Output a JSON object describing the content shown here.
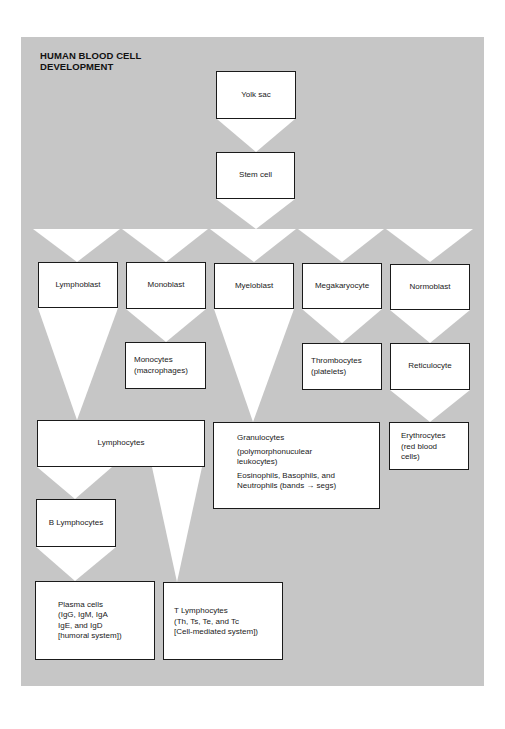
{
  "title_lines": [
    "HUMAN BLOOD CELL",
    "DEVELOPMENT"
  ],
  "colors": {
    "background": "#c6c6c6",
    "box_fill": "#ffffff",
    "box_border": "#1a1a1a",
    "flow": "#ffffff"
  },
  "nodes": {
    "yolk_sac": {
      "label": "Yolk sac"
    },
    "stem_cell": {
      "label": "Stem cell"
    },
    "lymphoblast": {
      "label": "Lymphoblast"
    },
    "monoblast": {
      "label": "Monoblast"
    },
    "myeloblast": {
      "label": "Myeloblast"
    },
    "megakaryocyte": {
      "label": "Megakaryocyte"
    },
    "normoblast": {
      "label": "Normoblast"
    },
    "monocytes": {
      "lines": [
        "Monocytes",
        "(macrophages)"
      ]
    },
    "thrombocytes": {
      "lines": [
        "Thrombocytes",
        "(platelets)"
      ]
    },
    "reticulocyte": {
      "label": "Reticulocyte"
    },
    "lymphocytes": {
      "label": "Lymphocytes"
    },
    "granulocytes": {
      "lines": [
        "Granulocytes",
        "(polymorphonuculear",
        "leukocytes)",
        "Eosinophils, Basophils, and",
        "Neutrophils (bands → segs)"
      ]
    },
    "erythrocytes": {
      "lines": [
        "Erythrocytes",
        "(red blood",
        "cells)"
      ]
    },
    "b_lymphocytes": {
      "label": "B Lymphocytes"
    },
    "plasma_cells": {
      "lines": [
        "Plasma cells",
        "(IgG, IgM, IgA",
        "IgE, and IgD",
        "[humoral system])"
      ]
    },
    "t_lymphocytes": {
      "lines": [
        "T Lymphocytes",
        "(Th, Ts, Te, and Tc",
        "[Cell-mediated system])"
      ]
    }
  },
  "edges": [
    [
      "Yolk sac",
      "Stem cell"
    ],
    [
      "Stem cell",
      "Lymphoblast"
    ],
    [
      "Stem cell",
      "Monoblast"
    ],
    [
      "Stem cell",
      "Myeloblast"
    ],
    [
      "Stem cell",
      "Megakaryocyte"
    ],
    [
      "Stem cell",
      "Normoblast"
    ],
    [
      "Lymphoblast",
      "Lymphocytes"
    ],
    [
      "Monoblast",
      "Monocytes (macrophages)"
    ],
    [
      "Myeloblast",
      "Granulocytes"
    ],
    [
      "Megakaryocyte",
      "Thrombocytes (platelets)"
    ],
    [
      "Normoblast",
      "Reticulocyte"
    ],
    [
      "Reticulocyte",
      "Erythrocytes (red blood cells)"
    ],
    [
      "Lymphocytes",
      "B Lymphocytes"
    ],
    [
      "Lymphocytes",
      "T Lymphocytes"
    ],
    [
      "B Lymphocytes",
      "Plasma cells"
    ]
  ]
}
